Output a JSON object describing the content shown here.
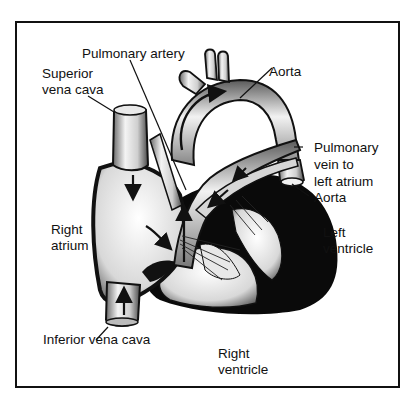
{
  "diagram": {
    "labels": {
      "pulmonary_artery": "Pulmonary artery",
      "superior_vena_cava_1": "Superior",
      "superior_vena_cava_2": "vena cava",
      "aorta_top": "Aorta",
      "pulmonary_vein_1": "Pulmonary",
      "pulmonary_vein_2": "vein to",
      "pulmonary_vein_3": "left atrium",
      "aorta_right": "Aorta",
      "right_atrium_1": "Right",
      "right_atrium_2": "atrium",
      "left_ventricle_1": "Left",
      "left_ventricle_2": "ventricle",
      "inferior_vena_cava": "Inferior vena cava",
      "right_ventricle_1": "Right",
      "right_ventricle_2": "ventricle"
    },
    "colors": {
      "ink": "#111111",
      "background": "#ffffff",
      "vessel_fill": "#d9d9d9"
    }
  }
}
